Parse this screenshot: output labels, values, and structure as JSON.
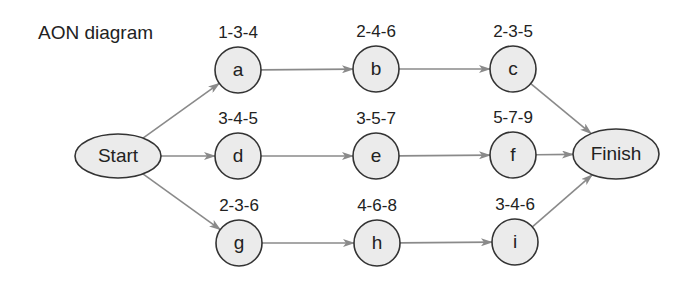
{
  "title": "AON diagram",
  "colors": {
    "node_fill": "#ebebeb",
    "node_stroke": "#333333",
    "arrow": "#8a8a8a"
  },
  "terminals": {
    "start": {
      "label": "Start",
      "cx": 118,
      "cy": 156,
      "rx": 43,
      "ry": 22
    },
    "finish": {
      "label": "Finish",
      "cx": 616,
      "cy": 154,
      "rx": 43,
      "ry": 25
    }
  },
  "nodes": [
    {
      "id": "a",
      "label": "a",
      "estimate": "1-3-4",
      "cx": 238,
      "cy": 70
    },
    {
      "id": "b",
      "label": "b",
      "estimate": "2-4-6",
      "cx": 376,
      "cy": 69
    },
    {
      "id": "c",
      "label": "c",
      "estimate": "2-3-5",
      "cx": 513,
      "cy": 69
    },
    {
      "id": "d",
      "label": "d",
      "estimate": "3-4-5",
      "cx": 238,
      "cy": 156
    },
    {
      "id": "e",
      "label": "e",
      "estimate": "3-5-7",
      "cx": 376,
      "cy": 156
    },
    {
      "id": "f",
      "label": "f",
      "estimate": "5-7-9",
      "cx": 513,
      "cy": 155
    },
    {
      "id": "g",
      "label": "g",
      "estimate": "2-3-6",
      "cx": 239,
      "cy": 243
    },
    {
      "id": "h",
      "label": "h",
      "estimate": "4-6-8",
      "cx": 377,
      "cy": 243
    },
    {
      "id": "i",
      "label": "i",
      "estimate": "3-4-6",
      "cx": 515,
      "cy": 242
    }
  ],
  "edges": [
    [
      "Start",
      "a"
    ],
    [
      "Start",
      "d"
    ],
    [
      "Start",
      "g"
    ],
    [
      "a",
      "b"
    ],
    [
      "b",
      "c"
    ],
    [
      "d",
      "e"
    ],
    [
      "e",
      "f"
    ],
    [
      "g",
      "h"
    ],
    [
      "h",
      "i"
    ],
    [
      "c",
      "Finish"
    ],
    [
      "f",
      "Finish"
    ],
    [
      "i",
      "Finish"
    ]
  ]
}
